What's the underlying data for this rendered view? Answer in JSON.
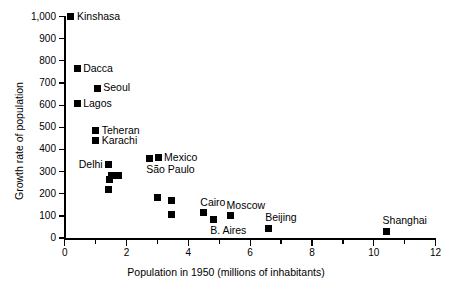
{
  "chart_data": {
    "type": "scatter",
    "title": "",
    "xlabel": "Population in 1950 (millions of inhabitants)",
    "ylabel": "Growth rate of population",
    "xlim": [
      0,
      12
    ],
    "ylim": [
      0,
      1000
    ],
    "xticks": [
      0,
      2,
      4,
      6,
      8,
      10,
      12
    ],
    "xtick_labels": [
      "0",
      "2",
      "4",
      "6",
      "8",
      "10",
      "12"
    ],
    "xminorticks": [
      1,
      3,
      5,
      7,
      9,
      11
    ],
    "yticks": [
      0,
      100,
      200,
      300,
      400,
      500,
      600,
      700,
      800,
      900,
      1000
    ],
    "ytick_labels": [
      "0",
      "100",
      "200",
      "300",
      "400",
      "500",
      "600",
      "700",
      "800",
      "900",
      "1,000"
    ],
    "grid": false,
    "legend": false,
    "marker": "filled-square",
    "marker_color": "#000000",
    "points": [
      {
        "label": "Kinshasa",
        "x": 0.2,
        "y": 1000,
        "label_pos": "right"
      },
      {
        "label": "Dacca",
        "x": 0.4,
        "y": 765,
        "label_pos": "right"
      },
      {
        "label": "Seoul",
        "x": 1.05,
        "y": 675,
        "label_pos": "right"
      },
      {
        "label": "Lagos",
        "x": 0.4,
        "y": 605,
        "label_pos": "right"
      },
      {
        "label": "Teheran",
        "x": 1.0,
        "y": 485,
        "label_pos": "right"
      },
      {
        "label": "Karachi",
        "x": 1.0,
        "y": 440,
        "label_pos": "right"
      },
      {
        "label": "Delhi",
        "x": 1.42,
        "y": 330,
        "label_pos": "left"
      },
      {
        "label": "",
        "x": 1.52,
        "y": 282,
        "label_pos": "none"
      },
      {
        "label": "",
        "x": 1.73,
        "y": 280,
        "label_pos": "none"
      },
      {
        "label": "",
        "x": 1.45,
        "y": 263,
        "label_pos": "none"
      },
      {
        "label": "",
        "x": 1.4,
        "y": 220,
        "label_pos": "none"
      },
      {
        "label": "São Paulo",
        "x": 2.75,
        "y": 360,
        "label_pos": "below"
      },
      {
        "label": "Mexico",
        "x": 3.02,
        "y": 363,
        "label_pos": "right"
      },
      {
        "label": "",
        "x": 3.0,
        "y": 185,
        "label_pos": "none"
      },
      {
        "label": "",
        "x": 3.45,
        "y": 170,
        "label_pos": "none"
      },
      {
        "label": "",
        "x": 3.45,
        "y": 105,
        "label_pos": "none"
      },
      {
        "label": "Cairo",
        "x": 4.5,
        "y": 115,
        "label_pos": "above"
      },
      {
        "label": "B. Aires",
        "x": 4.82,
        "y": 85,
        "label_pos": "below"
      },
      {
        "label": "Moscow",
        "x": 5.35,
        "y": 100,
        "label_pos": "above"
      },
      {
        "label": "Beijing",
        "x": 6.6,
        "y": 45,
        "label_pos": "above"
      },
      {
        "label": "Shanghai",
        "x": 10.4,
        "y": 30,
        "label_pos": "above"
      }
    ]
  }
}
